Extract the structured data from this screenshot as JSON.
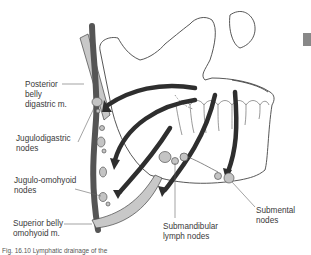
{
  "labels": {
    "posterior_belly": "Posterior\nbelly\ndigastric m.",
    "jugulodigastric": "Jugulodigastric\nnodes",
    "jugulo_omohyoid": "Jugulo-omohyoid\nnodes",
    "superior_belly": "Superior belly\nomohyoid m.",
    "submandibular": "Submandibular\nlymph nodes",
    "submental": "Submental\nnodes"
  },
  "caption": "Fig. 16.10 Lymphatic drainage of the",
  "colors": {
    "muscle_fill": "#c8c8c8",
    "vein": "#555555",
    "arrow": "#2e2e2e",
    "node_fill": "#c4c4c4",
    "outline": "#444444",
    "leader": "#666666",
    "tab_marker": "#888888"
  }
}
